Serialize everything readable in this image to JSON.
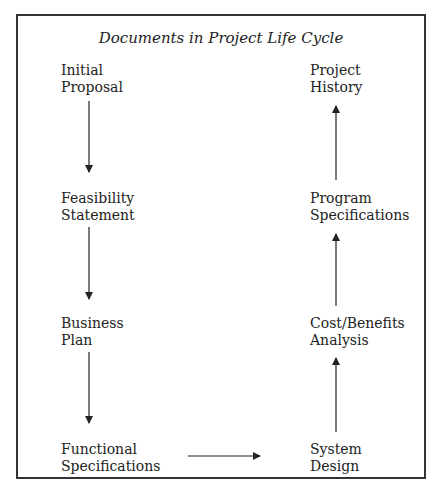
{
  "diagram": {
    "title": "Documents in Project Life Cycle",
    "nodes": [
      {
        "id": "initial-proposal",
        "line1": "Initial",
        "line2": "Proposal"
      },
      {
        "id": "feasibility-statement",
        "line1": "Feasibility",
        "line2": "Statement"
      },
      {
        "id": "business-plan",
        "line1": "Business",
        "line2": "Plan"
      },
      {
        "id": "functional-specifications",
        "line1": "Functional",
        "line2": "Specifications"
      },
      {
        "id": "system-design",
        "line1": "System",
        "line2": "Design"
      },
      {
        "id": "cost-benefits-analysis",
        "line1": "Cost/Benefits",
        "line2": "Analysis"
      },
      {
        "id": "program-specifications",
        "line1": "Program",
        "line2": "Specifications"
      },
      {
        "id": "project-history",
        "line1": "Project",
        "line2": "History"
      }
    ],
    "edges": [
      {
        "from": "initial-proposal",
        "to": "feasibility-statement"
      },
      {
        "from": "feasibility-statement",
        "to": "business-plan"
      },
      {
        "from": "business-plan",
        "to": "functional-specifications"
      },
      {
        "from": "functional-specifications",
        "to": "system-design"
      },
      {
        "from": "system-design",
        "to": "cost-benefits-analysis"
      },
      {
        "from": "cost-benefits-analysis",
        "to": "program-specifications"
      },
      {
        "from": "program-specifications",
        "to": "project-history"
      }
    ],
    "colors": {
      "line": "#222222",
      "border": "#333333"
    }
  }
}
